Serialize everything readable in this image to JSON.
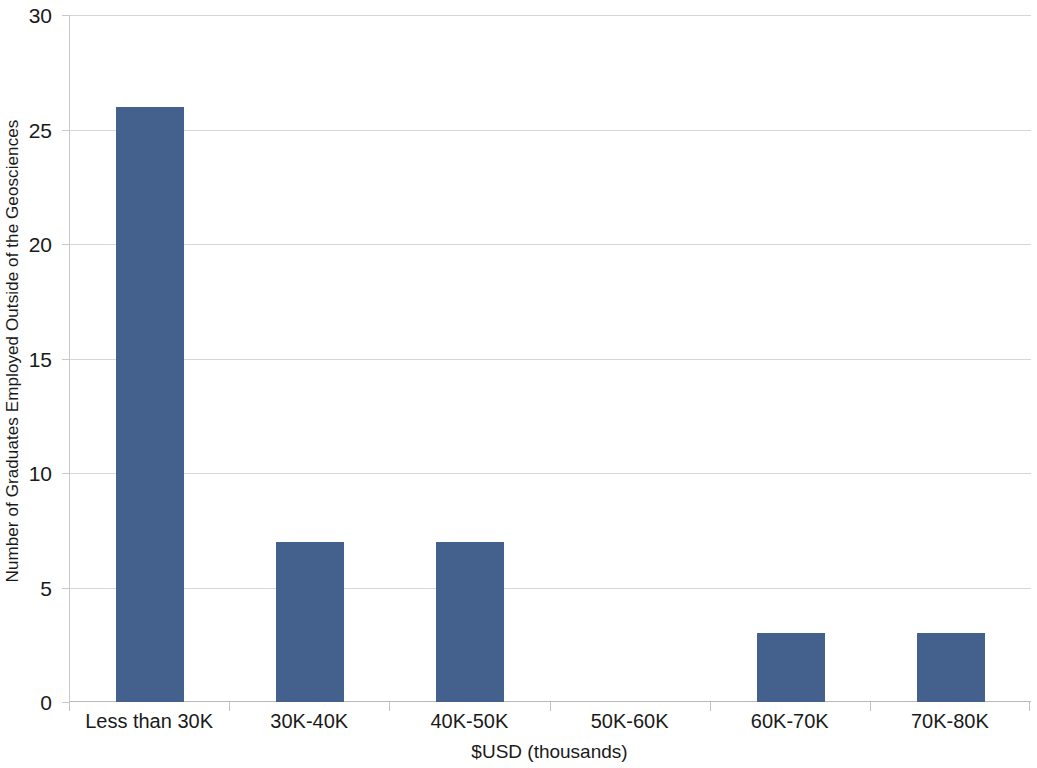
{
  "chart_data": {
    "type": "bar",
    "title": "",
    "subtitle": "",
    "xlabel": "$USD (thousands)",
    "ylabel": "Number of Graduates Employed Outside of the Geosciences",
    "categories": [
      "Less than 30K",
      "30K-40K",
      "40K-50K",
      "50K-60K",
      "60K-70K",
      "70K-80K"
    ],
    "values": [
      26,
      7,
      7,
      0,
      3,
      3
    ],
    "ylim": [
      0,
      30
    ],
    "ytick_values": [
      0,
      5,
      10,
      15,
      20,
      25,
      30
    ],
    "ytick_labels": [
      "0",
      "5",
      "10",
      "15",
      "20",
      "25",
      "30"
    ],
    "grid": true,
    "grid_axis": "y",
    "legend": false,
    "legend_position": "none",
    "bar_color": "#44608c",
    "gridline_color": "#d6d6d6",
    "axis_color": "#b9b9b9",
    "text_color": "#1a1a1a",
    "background_color": "#ffffff"
  }
}
